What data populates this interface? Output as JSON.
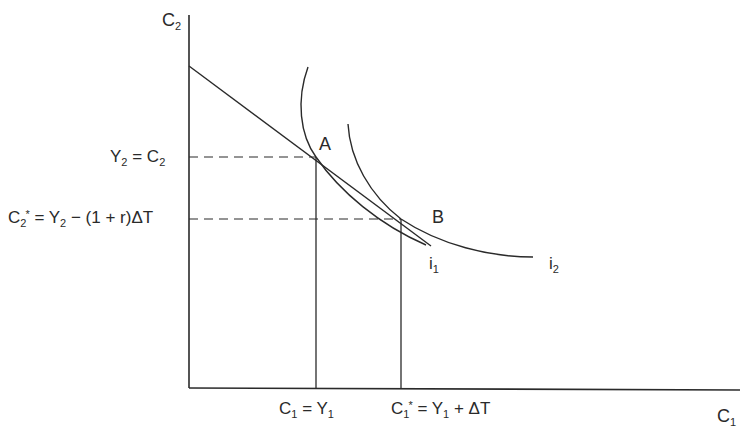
{
  "diagram": {
    "type": "intertemporal-consumption-choice",
    "axes": {
      "y_label": "C₂",
      "x_label": "C₁"
    },
    "y_tick_labels": {
      "y2_eq_c2": "Y₂ = C₂",
      "c2_star": "C₂* = Y₂ − (1 + r)ΔT"
    },
    "x_tick_labels": {
      "c1_eq_y1": "C₁ = Y₁",
      "c1_star": "C₁* = Y₁ + ΔT"
    },
    "points": {
      "A": "A",
      "B": "B"
    },
    "curves": {
      "i1": "i₁",
      "i2": "i₂"
    },
    "lines": {
      "budget_line": "budget constraint"
    }
  },
  "colors": {
    "ink": "#2a2a2a",
    "background": "#ffffff"
  }
}
